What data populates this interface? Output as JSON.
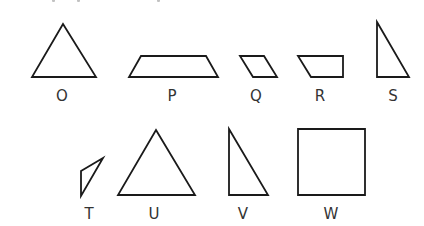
{
  "figure": {
    "stroke_color": "#1a1a1a",
    "label_color": "#333333",
    "shapes": [
      {
        "id": "O",
        "label": "O",
        "kind": "triangle",
        "points": "63,24 96,77 32,77",
        "label_x": 62,
        "label_y": 89
      },
      {
        "id": "P",
        "label": "P",
        "kind": "trapezoid",
        "points": "141,56 206,56 218,77 129,77",
        "label_x": 172,
        "label_y": 89
      },
      {
        "id": "Q",
        "label": "Q",
        "kind": "parallelogram",
        "points": "240,56 264,56 277,77 253,77",
        "label_x": 256,
        "label_y": 89
      },
      {
        "id": "R",
        "label": "R",
        "kind": "trapezoid",
        "points": "298,56 343,56 343,77 311,77",
        "label_x": 320,
        "label_y": 89
      },
      {
        "id": "S",
        "label": "S",
        "kind": "right-triangle",
        "points": "377,22 409,77 377,77",
        "label_x": 393,
        "label_y": 89
      },
      {
        "id": "T",
        "label": "T",
        "kind": "triangle",
        "points": "81,171 103,158 81,196",
        "label_x": 89,
        "label_y": 207
      },
      {
        "id": "U",
        "label": "U",
        "kind": "triangle",
        "points": "156,130 195,195 118,195",
        "label_x": 154,
        "label_y": 207
      },
      {
        "id": "V",
        "label": "V",
        "kind": "right-triangle",
        "points": "229,129 268,195 229,195",
        "label_x": 243,
        "label_y": 207
      },
      {
        "id": "W",
        "label": "W",
        "kind": "square",
        "points": "298,129 365,129 365,195 298,195",
        "label_x": 331,
        "label_y": 207
      }
    ]
  }
}
